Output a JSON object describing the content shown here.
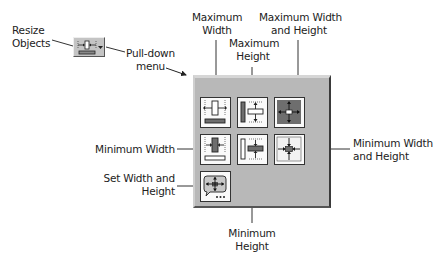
{
  "labels": {
    "resize_objects": [
      "Resize",
      "Objects"
    ],
    "pull_down_menu": [
      "Pull-down",
      "menu"
    ],
    "maximum_width": [
      "Maximum",
      "Width"
    ],
    "maximum_height": [
      "Maximum",
      "Height"
    ],
    "maximum_width_and_height": [
      "Maximum Width",
      "and Height"
    ],
    "minimum_width": "Minimum Width",
    "minimum_width_and_height": [
      "Minimum Width",
      "and Height"
    ],
    "set_width_and_height": [
      "Set Width and",
      "Height"
    ],
    "minimum_height": [
      "Minimum",
      "Height"
    ]
  },
  "toolbar_button": {
    "icon": "resize-objects-icon",
    "has_dropdown_arrow": true
  },
  "menu_items": [
    {
      "id": "maximum-width",
      "icon": "max-width-icon",
      "row": 0,
      "col": 0
    },
    {
      "id": "maximum-height",
      "icon": "max-height-icon",
      "row": 0,
      "col": 1
    },
    {
      "id": "maximum-width-and-height",
      "icon": "max-width-height-icon",
      "row": 0,
      "col": 2
    },
    {
      "id": "minimum-width",
      "icon": "min-width-icon",
      "row": 1,
      "col": 0
    },
    {
      "id": "minimum-height",
      "icon": "min-height-icon",
      "row": 1,
      "col": 1
    },
    {
      "id": "minimum-width-and-height",
      "icon": "min-width-height-icon",
      "row": 1,
      "col": 2
    },
    {
      "id": "set-width-and-height",
      "icon": "set-width-height-icon",
      "row": 2,
      "col": 0
    }
  ],
  "colors": {
    "panel_bg": "#b8b8b8",
    "tile_bg": "#fafafa",
    "dark_fill": "#6e6e6e",
    "text": "#222222"
  }
}
